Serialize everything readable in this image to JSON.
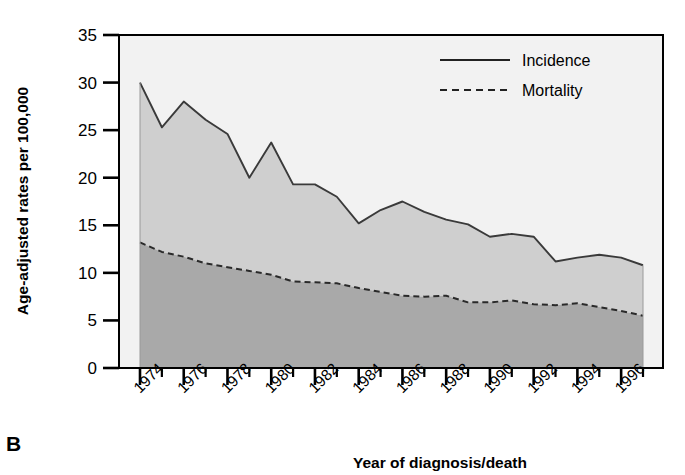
{
  "panel": {
    "letter": "B"
  },
  "chart_data": {
    "type": "area",
    "title": "",
    "xlabel": "Year of diagnosis/death",
    "ylabel": "Age-adjusted rates per 100,000",
    "xlim": [
      1974,
      1997
    ],
    "ylim": [
      0,
      35
    ],
    "yticks": [
      0,
      5,
      10,
      15,
      20,
      25,
      30,
      35
    ],
    "ytick_labels": [
      "0",
      "5",
      "10",
      "15",
      "20",
      "25",
      "30",
      "35"
    ],
    "xticks_major": [
      1974,
      1976,
      1978,
      1980,
      1982,
      1984,
      1986,
      1988,
      1990,
      1992,
      1994,
      1996
    ],
    "xtick_labels": [
      "1974",
      "1976",
      "1978",
      "1980",
      "1982",
      "1984",
      "1986",
      "1988",
      "1990",
      "1992",
      "1994",
      "1996"
    ],
    "xticks_minor": [
      1975,
      1977,
      1979,
      1981,
      1983,
      1985,
      1987,
      1989,
      1991,
      1993,
      1995,
      1997
    ],
    "grid": false,
    "legend_position": "top-right",
    "x": [
      1974,
      1975,
      1976,
      1977,
      1978,
      1979,
      1980,
      1981,
      1982,
      1983,
      1984,
      1985,
      1986,
      1987,
      1988,
      1989,
      1990,
      1991,
      1992,
      1993,
      1994,
      1995,
      1996,
      1997
    ],
    "series": [
      {
        "name": "Incidence",
        "style": "solid",
        "color": "#3a3a3a",
        "fill_color": "#cfcfcf",
        "values": [
          30.0,
          25.3,
          28.0,
          26.1,
          24.6,
          20.0,
          23.7,
          19.3,
          19.3,
          18.0,
          15.2,
          16.6,
          17.5,
          16.4,
          15.6,
          15.1,
          13.8,
          14.1,
          13.8,
          11.2,
          11.6,
          11.9,
          11.6,
          10.8
        ]
      },
      {
        "name": "Mortality",
        "style": "dashed",
        "color": "#2a2a2a",
        "fill_color": "#a9a9a9",
        "values": [
          13.2,
          12.2,
          11.7,
          11.0,
          10.6,
          10.2,
          9.8,
          9.1,
          9.0,
          8.9,
          8.4,
          8.0,
          7.6,
          7.5,
          7.6,
          6.9,
          6.9,
          7.1,
          6.7,
          6.6,
          6.8,
          6.4,
          6.0,
          5.5
        ]
      }
    ],
    "legend": [
      {
        "label": "Incidence",
        "style": "solid"
      },
      {
        "label": "Mortality",
        "style": "dashed"
      }
    ],
    "colors": {
      "incidence_band": "#cfcfcf",
      "mortality_band": "#a9a9a9",
      "line": "#3a3a3a",
      "frame": "#000000",
      "background": "#ffffff"
    }
  }
}
